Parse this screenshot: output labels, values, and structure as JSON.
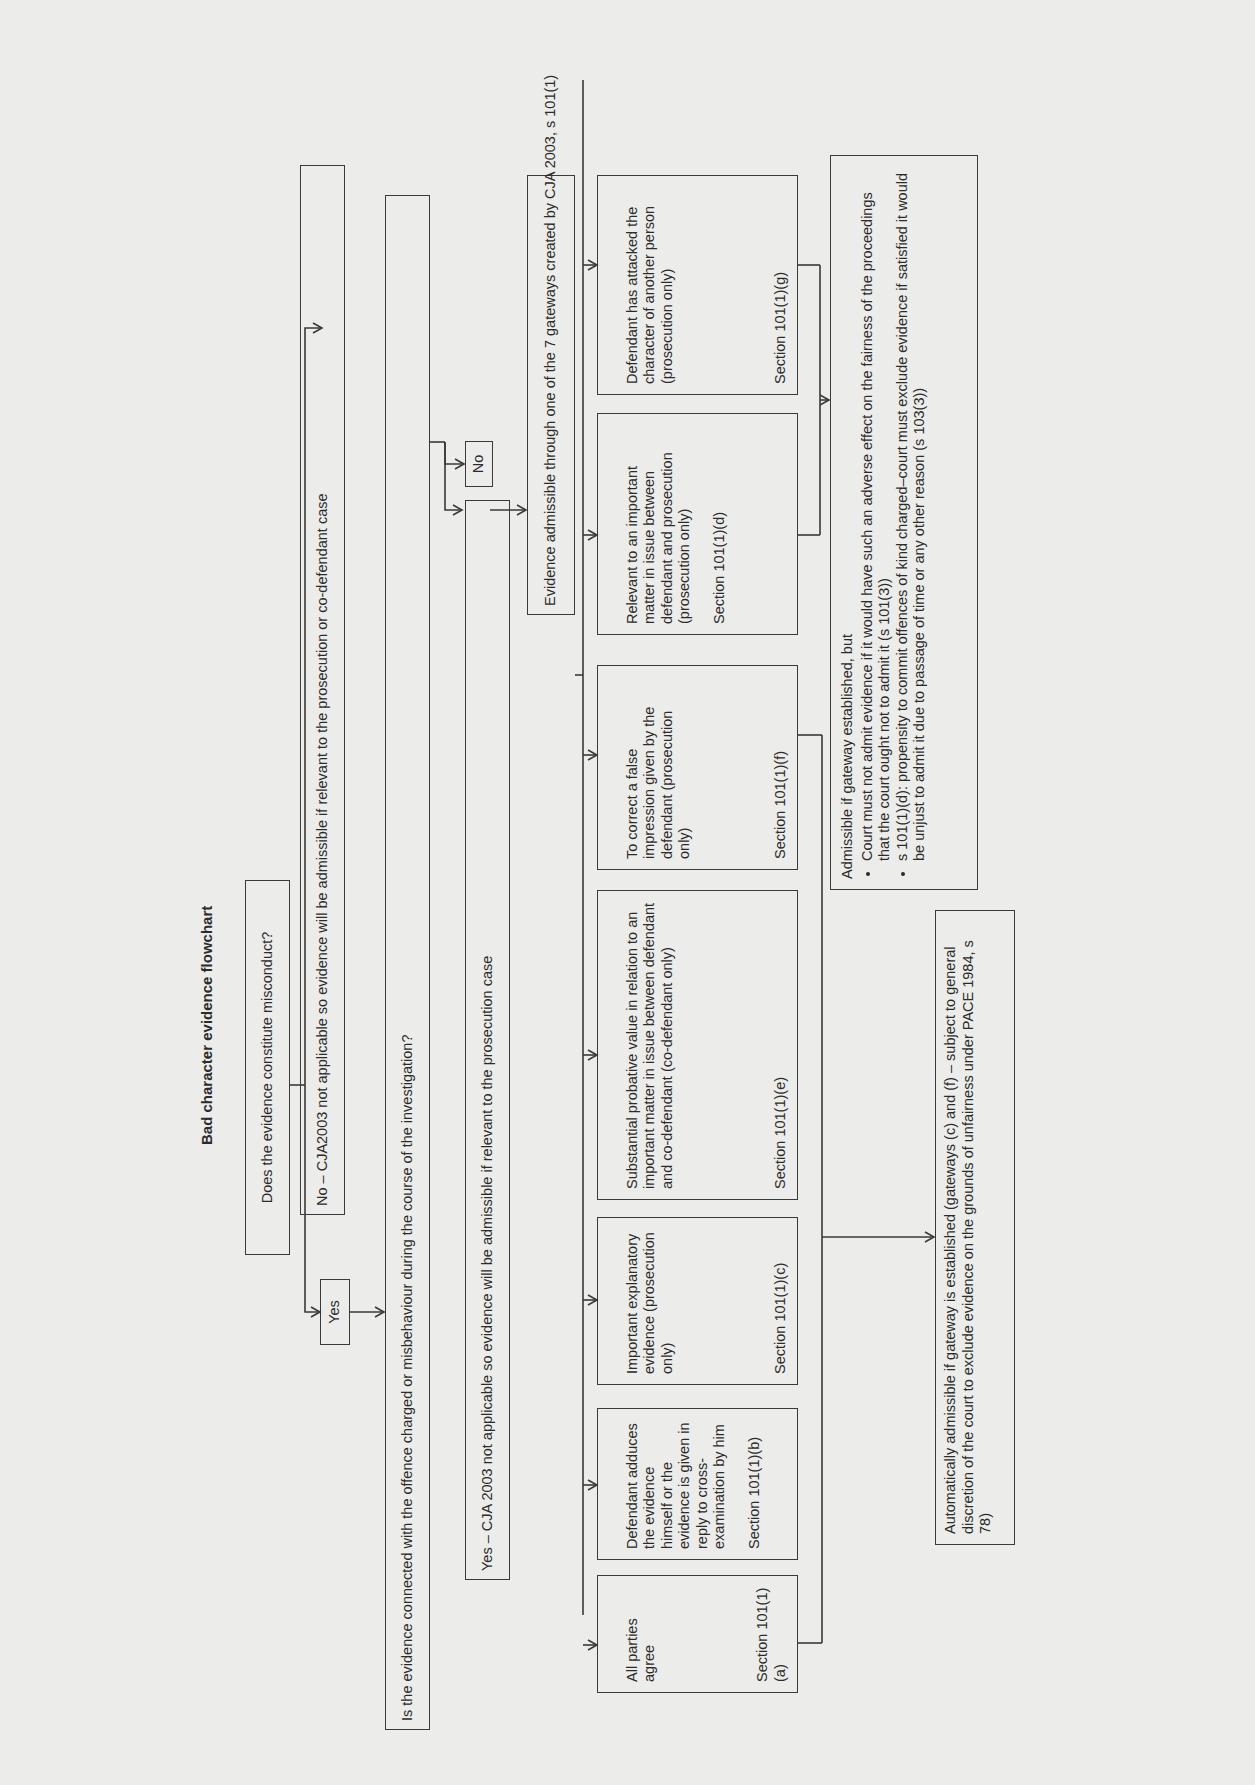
{
  "title": "Bad character evidence flowchart",
  "q1": "Does the evidence constitute misconduct?",
  "q1_yes": "Yes",
  "q1_no": "No – CJA2003 not applicable so evidence will be admissible if relevant to the prosecution or co-defendant case",
  "q2": "Is the evidence connected with the offence charged or misbehaviour during the course of the investigation?",
  "q2_yes": "Yes – CJA 2003 not applicable so evidence will be admissible if relevant to the prosecution case",
  "q2_no": "No",
  "gateway_header": "Evidence admissible through one of the 7 gateways created by CJA 2003, s 101(1)",
  "gateways": [
    {
      "id": "a",
      "text": "All parties agree",
      "section": "Section 101(1)(a)"
    },
    {
      "id": "b",
      "text": "Defendant adduces the evidence himself or the evidence is given in reply to cross-examination by him",
      "section": "Section 101(1)(b)"
    },
    {
      "id": "c",
      "text": "Important explanatory evidence (prosecution only)",
      "section": "Section 101(1)(c)"
    },
    {
      "id": "e",
      "text": "Substantial probative value in relation to an important matter in issue between defendant and co-defendant (co-defendant only)",
      "section": "Section 101(1)(e)"
    },
    {
      "id": "f",
      "text": "To correct a false impression given by the defendant (prosecution only)",
      "section": "Section 101(1)(f)"
    },
    {
      "id": "d",
      "text": "Relevant to an important matter in issue between defendant and prosecution (prosecution only)",
      "section": "Section 101(1)(d)"
    },
    {
      "id": "g",
      "text": "Defendant has attacked the character of another person (prosecution only)",
      "section": "Section 101(1)(g)"
    }
  ],
  "outcome_auto": "Automatically admissible if gateway is established (gateways (c) and (f) – subject to general discretion of the court to exclude evidence on the grounds of unfairness under PACE 1984, s 78)",
  "outcome_conditional": {
    "intro": "Admissible if gateway established, but",
    "bullets": [
      "Court must not admit evidence if it would have such an adverse effect on the fairness of the proceedings that the court ought not to admit it (s 101(3))",
      "s 101(1)(d): propensity to commit offences of kind charged–court must exclude evidence if satisfied it would be unjust to admit it due to passage of time or any other reason (s 103(3))"
    ]
  }
}
